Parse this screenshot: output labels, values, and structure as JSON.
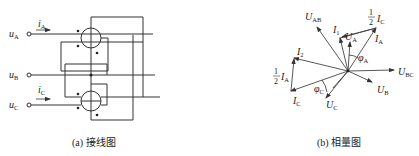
{
  "figure_a": {
    "caption": "(a) 接线图",
    "terminals": [
      {
        "label": "u",
        "sub": "A"
      },
      {
        "label": "u",
        "sub": "B"
      },
      {
        "label": "u",
        "sub": "C"
      }
    ],
    "currents": [
      {
        "label": "i",
        "sub": "A"
      },
      {
        "label": "i",
        "sub": "C"
      }
    ]
  },
  "figure_b": {
    "caption": "(b) 相量图",
    "phasors": {
      "UAB": {
        "label": "U",
        "sub": "AB"
      },
      "I1": {
        "label": "I",
        "sub": "1"
      },
      "UA": {
        "label": "U",
        "sub": "A"
      },
      "IA": {
        "label": "I",
        "sub": "A"
      },
      "halfIC": {
        "frac": "1/2",
        "label": "I",
        "sub": "C"
      },
      "I2": {
        "label": "I",
        "sub": "2"
      },
      "halfIA": {
        "frac": "1/2",
        "label": "I",
        "sub": "A"
      },
      "IC": {
        "label": "I",
        "sub": "C"
      },
      "UC": {
        "label": "U",
        "sub": "C"
      },
      "UB": {
        "label": "U",
        "sub": "B"
      },
      "UBC": {
        "label": "U",
        "sub": "BC"
      },
      "phiA": {
        "label": "φ",
        "sub": "A"
      },
      "phiC": {
        "label": "φ",
        "sub": "C"
      }
    }
  }
}
